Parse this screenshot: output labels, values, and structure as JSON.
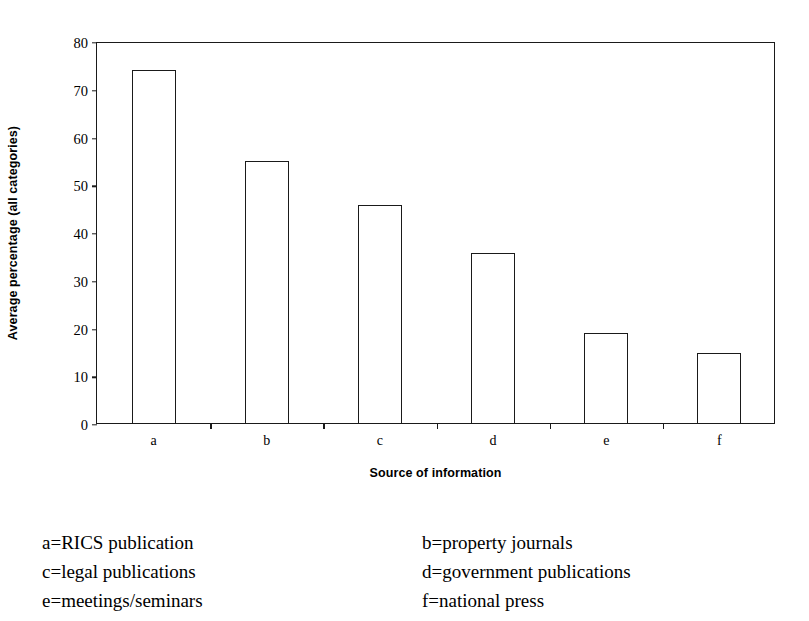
{
  "chart_data": {
    "type": "bar",
    "title": "",
    "xlabel": "Source of information",
    "ylabel": "Average percentage (all categories)",
    "categories": [
      "a",
      "b",
      "c",
      "d",
      "e",
      "f"
    ],
    "values": [
      74,
      54.9,
      45.7,
      35.6,
      18.8,
      14.7
    ],
    "ylim": [
      0,
      80
    ],
    "yticks": [
      0,
      10,
      20,
      30,
      40,
      50,
      60,
      70,
      80
    ],
    "ytick_labels": [
      "0",
      "10",
      "20",
      "30",
      "40",
      "50",
      "60",
      "70",
      "80"
    ],
    "grid": false,
    "legend_position": "below-plot",
    "series": [
      {
        "name": "Average percentage (all categories)",
        "values": [
          74,
          54.9,
          45.7,
          35.6,
          18.8,
          14.7
        ]
      }
    ],
    "bar_style": {
      "fill": "#ffffff",
      "edge": "#1a1a1a"
    }
  },
  "axes": {
    "y_title": "Average percentage (all categories)",
    "x_title": "Source of information",
    "y_ticks": [
      {
        "value": 80,
        "label": "80"
      },
      {
        "value": 70,
        "label": "70"
      },
      {
        "value": 60,
        "label": "60"
      },
      {
        "value": 50,
        "label": "50"
      },
      {
        "value": 40,
        "label": "40"
      },
      {
        "value": 30,
        "label": "30"
      },
      {
        "value": 20,
        "label": "20"
      },
      {
        "value": 10,
        "label": "10"
      },
      {
        "value": 0,
        "label": "0"
      }
    ],
    "x_categories": [
      {
        "key": "a",
        "label": "a",
        "value": 74
      },
      {
        "key": "b",
        "label": "b",
        "value": 54.9
      },
      {
        "key": "c",
        "label": "c",
        "value": 45.7
      },
      {
        "key": "d",
        "label": "d",
        "value": 35.6
      },
      {
        "key": "e",
        "label": "e",
        "value": 18.8
      },
      {
        "key": "f",
        "label": "f",
        "value": 14.7
      }
    ]
  },
  "legend": {
    "rows": [
      {
        "left": "a=RICS publication",
        "right": "b=property journals"
      },
      {
        "left": "c=legal publications",
        "right": "d=government publications"
      },
      {
        "left": "e=meetings/seminars",
        "right": "f=national press"
      }
    ]
  },
  "colors": {
    "background": "#ffffff",
    "ink": "#1a1a1a",
    "bar_fill": "#ffffff",
    "bar_edge": "#1a1a1a"
  }
}
